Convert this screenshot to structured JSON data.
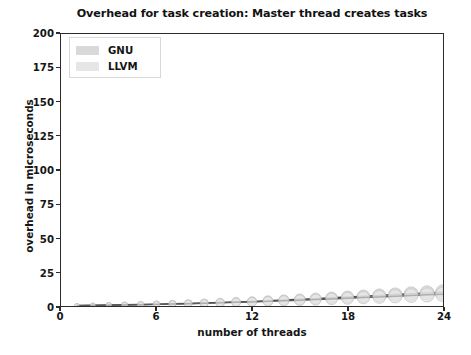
{
  "chart_data": {
    "type": "line",
    "title": "Overhead for task creation: Master thread creates tasks",
    "xlabel": "number of threads",
    "ylabel": "overhead in microseconds",
    "xlim": [
      0,
      24
    ],
    "ylim": [
      0,
      200
    ],
    "xticks": [
      0,
      6,
      12,
      18,
      24
    ],
    "xtick_labels": [
      "0",
      "6",
      "12",
      "18",
      "24"
    ],
    "yticks": [
      0,
      25,
      50,
      75,
      100,
      125,
      150,
      175,
      200
    ],
    "ytick_labels": [
      "0",
      "25",
      "50",
      "75",
      "100",
      "125",
      "150",
      "175",
      "200"
    ],
    "grid": false,
    "legend_position": "upper left",
    "marker": "circle",
    "x": [
      1,
      2,
      3,
      4,
      5,
      6,
      7,
      8,
      9,
      10,
      11,
      12,
      13,
      14,
      15,
      16,
      17,
      18,
      19,
      20,
      21,
      22,
      23,
      24
    ],
    "series": [
      {
        "name": "GNU",
        "color": "#d9d9d9",
        "line_color": "#4a4a4a",
        "values": [
          0.3,
          0.5,
          0.7,
          0.9,
          1.1,
          1.3,
          1.6,
          1.9,
          2.2,
          2.6,
          3.0,
          3.4,
          3.9,
          4.4,
          4.9,
          5.4,
          6.0,
          6.6,
          7.2,
          7.8,
          8.4,
          9.0,
          9.6,
          10.2
        ]
      },
      {
        "name": "LLVM",
        "color": "#e6e6e6",
        "line_color": "#5a5a5a",
        "values": [
          0.2,
          0.4,
          0.6,
          0.8,
          1.0,
          1.2,
          1.4,
          1.7,
          2.0,
          2.3,
          2.7,
          3.0,
          3.4,
          3.8,
          4.3,
          4.7,
          5.2,
          5.7,
          6.2,
          6.7,
          7.2,
          7.7,
          8.2,
          8.7
        ]
      }
    ]
  },
  "legend": {
    "entries": [
      {
        "label": "GNU"
      },
      {
        "label": "LLVM"
      }
    ]
  }
}
